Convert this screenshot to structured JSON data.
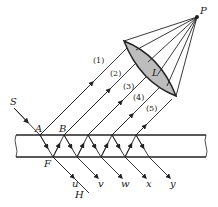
{
  "diagram": {
    "points": {
      "P": "P",
      "L": "L",
      "S": "S",
      "A": "A",
      "B": "B",
      "F": "F",
      "H": "H"
    },
    "reflected_rays": [
      "(1)",
      "(2)",
      "(3)",
      "(4)",
      "(5)"
    ],
    "transmitted_rays": [
      "u",
      "v",
      "w",
      "x",
      "y"
    ],
    "colors": {
      "line": "#222222",
      "lens_fill": "#bdbdbd",
      "background": "#ffffff"
    }
  }
}
